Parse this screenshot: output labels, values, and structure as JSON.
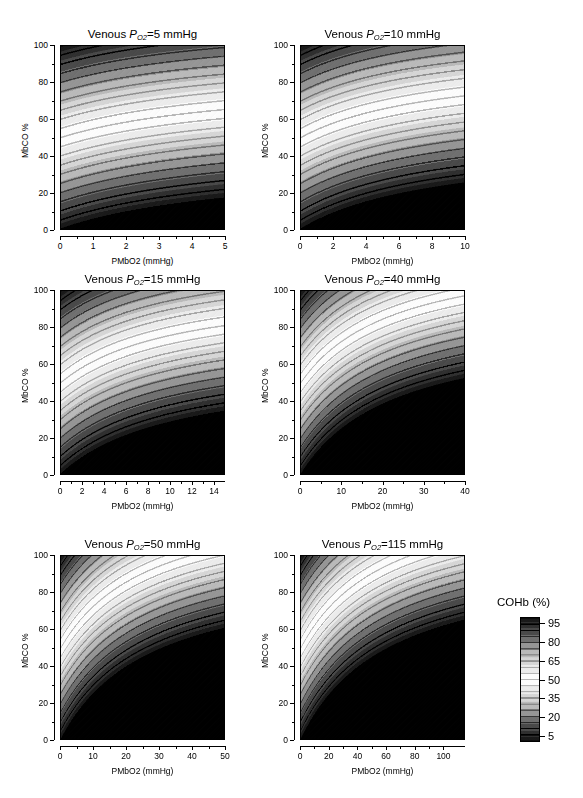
{
  "figure": {
    "type": "contour-panel-grid",
    "rows": 3,
    "cols": 2,
    "background": "#ffffff"
  },
  "legend": {
    "title": "COHb (%)",
    "tick_labels": [
      "95",
      "80",
      "65",
      "50",
      "35",
      "20",
      "5"
    ],
    "tick_values": [
      95,
      80,
      65,
      50,
      35,
      20,
      5
    ],
    "range": [
      0,
      100
    ],
    "orientation": "vertical",
    "position": "right-bottom"
  },
  "chart_data": {
    "type": "heatmap",
    "title": "",
    "colormap": "grayscale-banded-diverging",
    "colorbar": {
      "label": "COHb (%)",
      "ticks": [
        5,
        20,
        35,
        50,
        65,
        80,
        95
      ],
      "range": [
        0,
        100
      ],
      "description": "dark at low values, light near 50, dark at high values"
    },
    "shared": {
      "xlabel": "PMbO2 (mmHg)",
      "ylabel": "MbCO %",
      "ylim": [
        0,
        100
      ],
      "yticks": [
        0,
        20,
        40,
        60,
        80,
        100
      ],
      "zlabel": "COHb (%)",
      "zlim": [
        0,
        100
      ],
      "contour_levels": [
        5,
        10,
        15,
        20,
        25,
        30,
        35,
        40,
        45,
        50,
        55,
        60,
        65,
        70,
        75,
        80,
        85,
        90,
        95
      ]
    },
    "panels": [
      {
        "title_prefix": "Venous ",
        "title_symbol": "P",
        "title_sub": "O",
        "title_sub2": "2",
        "title_suffix": "=5 mmHg",
        "venous_po2": 5,
        "xlim": [
          0,
          5
        ],
        "xticks": [
          0,
          1,
          2,
          3,
          4,
          5
        ],
        "xlabel": "PMbO2 (mmHg)",
        "ylabel": "MbCO %",
        "shape": "shallow-decay",
        "curvature": 0.3
      },
      {
        "title_prefix": "Venous ",
        "title_symbol": "P",
        "title_sub": "O",
        "title_sub2": "2",
        "title_suffix": "=10 mmHg",
        "venous_po2": 10,
        "xlim": [
          0,
          10
        ],
        "xticks": [
          0,
          2,
          4,
          6,
          8,
          10
        ],
        "xlabel": "PMbO2 (mmHg)",
        "ylabel": "MbCO %",
        "shape": "shallow-decay",
        "curvature": 0.45
      },
      {
        "title_prefix": "Venous ",
        "title_symbol": "P",
        "title_sub": "O",
        "title_sub2": "2",
        "title_suffix": "=15 mmHg",
        "venous_po2": 15,
        "xlim": [
          0,
          15
        ],
        "xticks": [
          0,
          2,
          4,
          6,
          8,
          10,
          12,
          14
        ],
        "xlabel": "PMbO2 (mmHg)",
        "ylabel": "MbCO %",
        "shape": "hyperbolic-decay",
        "curvature": 0.6
      },
      {
        "title_prefix": "Venous ",
        "title_symbol": "P",
        "title_sub": "O",
        "title_sub2": "2",
        "title_suffix": "=40 mmHg",
        "venous_po2": 40,
        "xlim": [
          0,
          40
        ],
        "xticks": [
          0,
          10,
          20,
          30,
          40
        ],
        "xlabel": "PMbO2 (mmHg)",
        "ylabel": "MbCO %",
        "shape": "hyperbolic-decay",
        "curvature": 0.85
      },
      {
        "title_prefix": "Venous ",
        "title_symbol": "P",
        "title_sub": "O",
        "title_sub2": "2",
        "title_suffix": "=50 mmHg",
        "venous_po2": 50,
        "xlim": [
          0,
          50
        ],
        "xticks": [
          0,
          10,
          20,
          30,
          40,
          50
        ],
        "xlabel": "PMbO2 (mmHg)",
        "ylabel": "MbCO %",
        "shape": "hyperbolic-decay",
        "curvature": 0.95
      },
      {
        "title_prefix": "Venous ",
        "title_symbol": "P",
        "title_sub": "O",
        "title_sub2": "2",
        "title_suffix": "=115 mmHg",
        "venous_po2": 115,
        "xlim": [
          0,
          115
        ],
        "xticks": [
          0,
          20,
          40,
          60,
          80,
          100
        ],
        "xlabel": "PMbO2 (mmHg)",
        "ylabel": "MbCO %",
        "shape": "hyperbolic-decay",
        "curvature": 1.0
      }
    ]
  }
}
